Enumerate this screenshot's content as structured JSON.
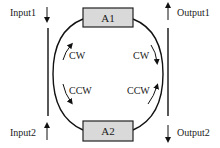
{
  "diagram": {
    "type": "ring-resonator-coupling",
    "ports": {
      "input1": {
        "label": "Input1",
        "direction": "down"
      },
      "input2": {
        "label": "Input2",
        "direction": "up"
      },
      "output1": {
        "label": "Output1",
        "direction": "up"
      },
      "output2": {
        "label": "Output2",
        "direction": "down"
      }
    },
    "boxes": {
      "top": {
        "label": "A1"
      },
      "bottom": {
        "label": "A2"
      }
    },
    "modes": {
      "left_upper": "CW",
      "left_lower": "CCW",
      "right_upper": "CW",
      "right_lower": "CCW"
    },
    "colors": {
      "line": "#111111",
      "box_fill": "#d9d9d9",
      "box_stroke": "#222222"
    }
  }
}
